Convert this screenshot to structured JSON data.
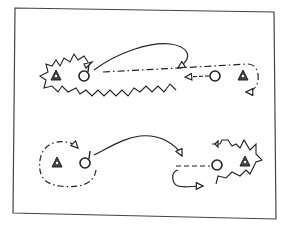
{
  "diagram": {
    "type": "sports-drill-diagram",
    "frame": {
      "x": 14,
      "y": 7,
      "width": 262,
      "height": 212,
      "stroke": "#333333"
    },
    "legend_symbols": {
      "player-circle": "O",
      "cone-triangle-filled": "▲",
      "arrow-head-triangle": "◁"
    },
    "colors": {
      "ink": "#222222",
      "background": "#ffffff"
    },
    "drills": [
      {
        "name": "top-drill",
        "elements": [
          "jagged-skate-path",
          "cone-left",
          "player-left-with-stick",
          "arc-pass-path",
          "dash-dot-pass-line",
          "player-right",
          "cone-right",
          "dashed-loop-return"
        ]
      },
      {
        "name": "bottom-drill",
        "elements": [
          "dash-dot-loop",
          "cone-left",
          "player-left-with-stick",
          "arc-pass-path",
          "dashed-line",
          "player-right",
          "cone-right",
          "jagged-skate-path",
          "curved-return-arrow"
        ]
      }
    ]
  }
}
